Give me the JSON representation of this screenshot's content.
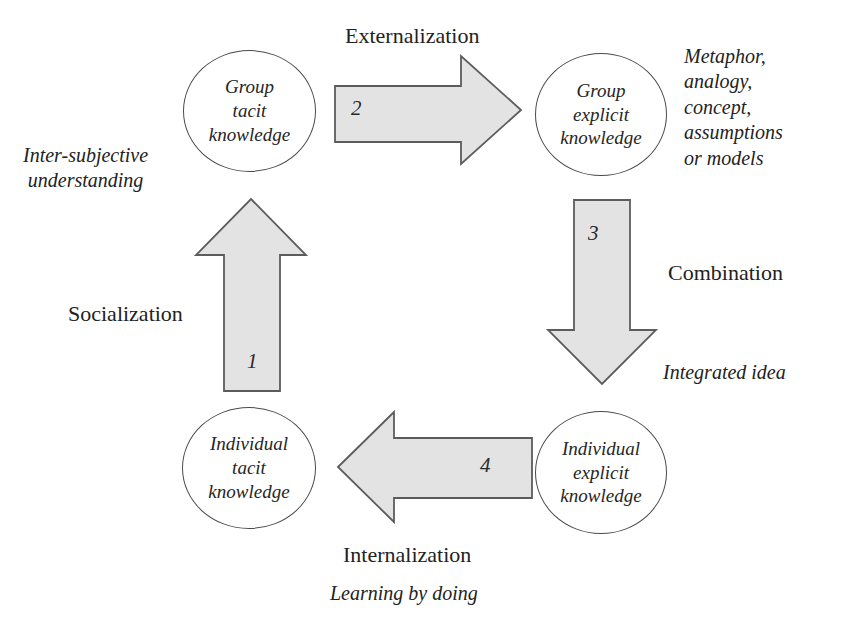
{
  "diagram": {
    "accent_fill": "#e3e3e3",
    "stroke": "#5c5c5c",
    "nodes": [
      {
        "id": "group-tacit",
        "lines": [
          "Group",
          "tacit",
          "knowledge"
        ]
      },
      {
        "id": "group-explicit",
        "lines": [
          "Group",
          "explicit",
          "knowledge"
        ]
      },
      {
        "id": "ind-tacit",
        "lines": [
          "Individual",
          "tacit",
          "knowledge"
        ]
      },
      {
        "id": "ind-explicit",
        "lines": [
          "Individual",
          "explicit",
          "knowledge"
        ]
      }
    ],
    "steps": {
      "one": "1",
      "two": "2",
      "three": "3",
      "four": "4"
    },
    "processes": {
      "externalization": "Externalization",
      "socialization": "Socialization",
      "combination": "Combination",
      "internalization": "Internalization"
    },
    "notes": {
      "metaphor": "Metaphor,\nanalogy,\nconcept,\nassumptions\nor models",
      "intersubjective": "Inter-subjective\nunderstanding",
      "integrated_idea": "Integrated idea",
      "learning_by_doing": "Learning by doing"
    }
  }
}
